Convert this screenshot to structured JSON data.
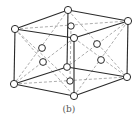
{
  "figure": {
    "caption": "(b)",
    "type": "hexagonal close-packed unit cell",
    "colors": {
      "edge": "#2a2a2a",
      "dashed": "#8a8a8a",
      "atom_fill": "#ffffff",
      "background": "#ffffff"
    },
    "atoms": {
      "top_center": [
        68,
        10
      ],
      "top_back_inner": [
        71,
        26
      ],
      "top_left": [
        15,
        29
      ],
      "top_right": [
        128,
        21
      ],
      "top_front": [
        74,
        38
      ],
      "mid_left_upper": [
        42,
        48
      ],
      "mid_left_lower": [
        43,
        62
      ],
      "mid_right_upper": [
        97,
        44
      ],
      "mid_right_lower": [
        101,
        60
      ],
      "bottom_back_inner": [
        67,
        67
      ],
      "bottom_center_inner": [
        70,
        81
      ],
      "bottom_left": [
        14,
        84
      ],
      "bottom_right": [
        127,
        77
      ],
      "bottom_front": [
        74,
        96
      ]
    }
  }
}
